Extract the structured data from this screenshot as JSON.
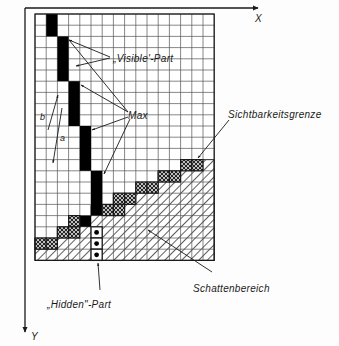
{
  "figure": {
    "kind": "raster-grid-visibility-diagram",
    "colors": {
      "ink": "#1a1a1a",
      "grid": "#555555",
      "visible_cell": "#000000",
      "background": "#ffffff",
      "page": "#fdfdfd"
    },
    "grid": {
      "origin_x": 35,
      "origin_y": 14,
      "cell": 11.2,
      "cols": 16,
      "rows": 22
    }
  },
  "axes": {
    "x_label": "X",
    "y_label": "Y"
  },
  "labels": {
    "visible_part": "„Visible'-Part",
    "max": "Max",
    "hidden_part": "„Hidden\"-Part",
    "sichtbarkeitsgrenze": "Sichtbarkeitsgrenze",
    "schattenbereich": "Schattenbereich",
    "a": "a",
    "b": "b"
  },
  "cells": {
    "visible_black": [
      {
        "col": 1,
        "row": 0,
        "span": 2
      },
      {
        "col": 2,
        "row": 2,
        "span": 4
      },
      {
        "col": 3,
        "row": 6,
        "span": 4
      },
      {
        "col": 4,
        "row": 10,
        "span": 4
      },
      {
        "col": 5,
        "row": 14,
        "span": 4
      },
      {
        "col": 4,
        "row": 18,
        "span": 1
      }
    ],
    "boundary_crosshatch": [
      {
        "col": 11,
        "row": 13
      },
      {
        "col": 12,
        "row": 13
      },
      {
        "col": 9,
        "row": 14
      },
      {
        "col": 10,
        "row": 14
      },
      {
        "col": 7,
        "row": 15
      },
      {
        "col": 8,
        "row": 15
      },
      {
        "col": 5,
        "row": 16
      },
      {
        "col": 6,
        "row": 16
      },
      {
        "col": 4,
        "row": 17
      },
      {
        "col": 3,
        "row": 18
      },
      {
        "col": 2,
        "row": 19
      },
      {
        "col": 3,
        "row": 19
      },
      {
        "col": 0,
        "row": 20
      },
      {
        "col": 1,
        "row": 20
      }
    ],
    "hidden_dotted": [
      {
        "col": 5,
        "row": 19
      },
      {
        "col": 5,
        "row": 20
      },
      {
        "col": 5,
        "row": 21
      }
    ]
  }
}
